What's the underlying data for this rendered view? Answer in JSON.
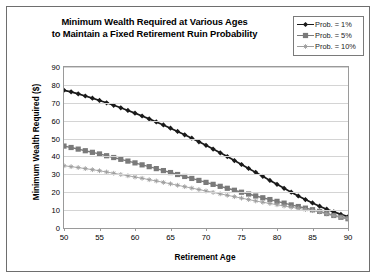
{
  "chart_data": {
    "type": "line",
    "title": "Minimum Wealth Required at Various Ages to Maintain a Fixed Retirement Ruin Probability",
    "title_line1": "Minimum Wealth Required at Various Ages",
    "title_line2": "to Maintain a Fixed Retirement Ruin Probability",
    "xlabel": "Retirement Age",
    "ylabel": "Minimum Wealth Required ($)",
    "xlim": [
      50,
      90
    ],
    "ylim": [
      0,
      90
    ],
    "xticks": [
      50,
      55,
      60,
      65,
      70,
      75,
      80,
      85,
      90
    ],
    "yticks": [
      0,
      10,
      20,
      30,
      40,
      50,
      60,
      70,
      80,
      90
    ],
    "grid": "horizontal",
    "legend_position": "top-right",
    "x": [
      50,
      51,
      52,
      53,
      54,
      55,
      56,
      57,
      58,
      59,
      60,
      61,
      62,
      63,
      64,
      65,
      66,
      67,
      68,
      69,
      70,
      71,
      72,
      73,
      74,
      75,
      76,
      77,
      78,
      79,
      80,
      81,
      82,
      83,
      84,
      85,
      86,
      87,
      88,
      89,
      90
    ],
    "series": [
      {
        "name": "Prob. = 1%",
        "color": "#1a1a1a",
        "marker": "diamond",
        "values": [
          77.0,
          76.1,
          75.0,
          73.8,
          72.6,
          71.3,
          70.0,
          68.6,
          67.2,
          65.7,
          64.2,
          62.6,
          61.0,
          59.3,
          57.6,
          55.8,
          54.0,
          52.1,
          50.2,
          48.2,
          46.2,
          44.1,
          42.0,
          39.9,
          37.7,
          35.5,
          33.3,
          31.1,
          28.9,
          26.6,
          24.4,
          22.2,
          20.0,
          17.9,
          15.9,
          14.0,
          12.2,
          10.5,
          9.0,
          7.6,
          6.3
        ]
      },
      {
        "name": "Prob. = 5%",
        "color": "#7a7a7a",
        "marker": "square",
        "values": [
          45.8,
          45.0,
          44.1,
          43.2,
          42.3,
          41.4,
          40.4,
          39.4,
          38.4,
          37.4,
          36.4,
          35.3,
          34.3,
          33.2,
          32.1,
          31.0,
          29.9,
          28.8,
          27.7,
          26.6,
          25.5,
          24.4,
          23.3,
          22.2,
          21.1,
          20.0,
          19.0,
          17.9,
          16.9,
          15.9,
          14.9,
          13.9,
          12.9,
          12.0,
          11.1,
          10.2,
          9.3,
          8.1,
          7.0,
          6.0,
          5.2
        ]
      },
      {
        "name": "Prob. = 10%",
        "color": "#9e9e9e",
        "marker": "star",
        "values": [
          34.8,
          34.3,
          33.8,
          33.2,
          32.6,
          32.0,
          31.3,
          30.6,
          29.9,
          29.2,
          28.5,
          27.8,
          27.0,
          26.3,
          25.5,
          24.7,
          23.9,
          23.1,
          22.3,
          21.5,
          20.7,
          19.9,
          19.1,
          18.3,
          17.5,
          16.7,
          15.9,
          15.1,
          14.4,
          13.7,
          13.0,
          12.3,
          11.6,
          11.0,
          10.3,
          9.7,
          9.0,
          7.9,
          6.9,
          6.0,
          5.2
        ]
      }
    ]
  }
}
